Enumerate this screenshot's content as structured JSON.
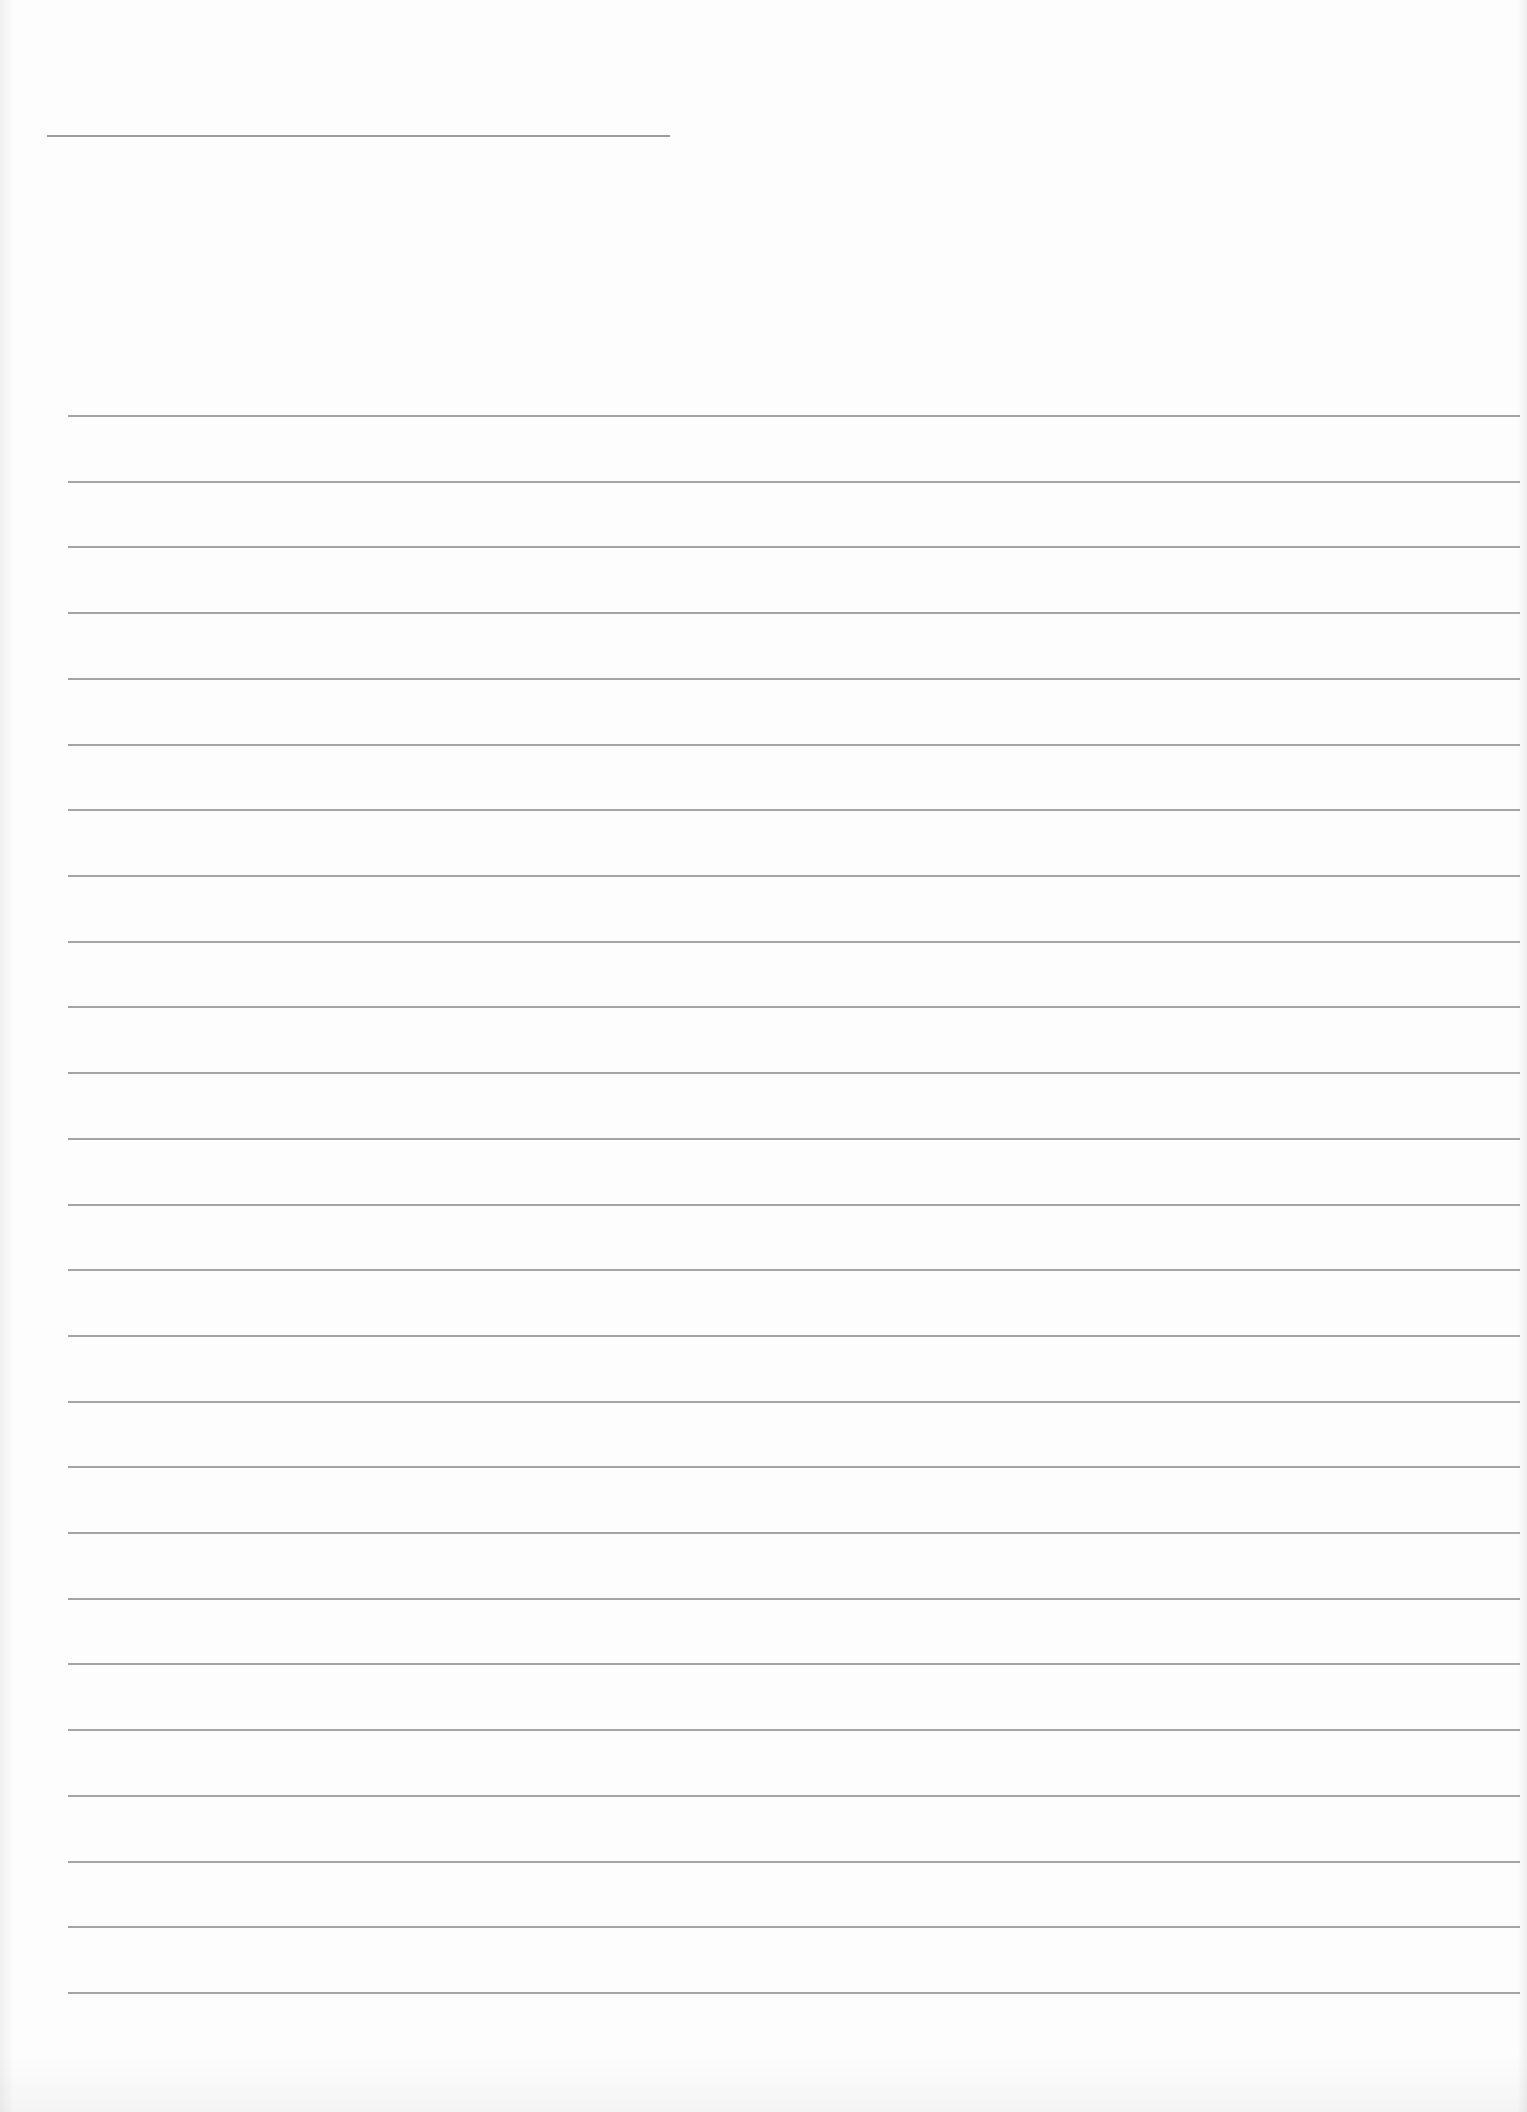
{
  "document": {
    "type": "lined writing sheet",
    "title_line": {
      "text": "",
      "x_start": 47,
      "x_end": 670,
      "y": 136
    },
    "ruled_lines": {
      "count": 25,
      "x_start": 68,
      "x_end": 1520,
      "first_y": 416,
      "last_y": 1993,
      "spacing": 65.7,
      "line_color": "#8d8d8d",
      "entries": [
        "",
        "",
        "",
        "",
        "",
        "",
        "",
        "",
        "",
        "",
        "",
        "",
        "",
        "",
        "",
        "",
        "",
        "",
        "",
        "",
        "",
        "",
        "",
        "",
        ""
      ]
    },
    "paper_color": "#fdfdfd"
  }
}
